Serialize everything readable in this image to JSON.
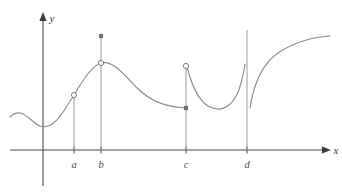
{
  "figure": {
    "background_color": "#ffffff",
    "curve_color": "#8c8c94",
    "axis_color": "#4a4a4a",
    "marker_color": "#7a7a82",
    "dropline_color": "#9a9aa2",
    "axes": {
      "x_label": "x",
      "y_label": "y"
    },
    "tick_labels": [
      "a",
      "b",
      "c",
      "d"
    ]
  },
  "chart_data": {
    "type": "line",
    "title": "",
    "xlabel": "x",
    "ylabel": "y",
    "grid": false,
    "legend": null,
    "xlim": [
      0,
      342
    ],
    "ylim": [
      0,
      196
    ],
    "axis_origin_px": {
      "x": 35,
      "y": 150
    },
    "tick_positions_px": [
      74,
      101,
      186,
      247
    ],
    "tick_labels": [
      "a",
      "b",
      "c",
      "d"
    ],
    "segments": [
      {
        "name": "left-branch",
        "from_label": "start",
        "to_label": "b-peak",
        "path": "M 10,117 C 22,105 30,122 40,126 C 52,130 60,118 74,95 C 84,78 92,66 101,63",
        "note": "Enters from upper left, dips to a local minimum near x just right of the y-axis, then rises steeply through a to a local maximum at b."
      },
      {
        "name": "b-to-c-branch",
        "from_label": "b-peak",
        "to_label": "c-left",
        "path": "M 101,63 C 112,60 122,72 136,87 C 152,103 168,107 186,108",
        "note": "Descends from the peak at b and flattens out approaching c from the left."
      },
      {
        "name": "c-to-d-branch",
        "from_label": "c-right",
        "to_label": "d-left",
        "path": "M 187,67 C 192,86 198,100 208,106 C 220,113 232,108 239,90 C 242,80 244,72 245,64",
        "note": "Starts high just right of c, falls to a local minimum, then rises steeply toward the vertical asymptote at d."
      },
      {
        "name": "after-d-branch",
        "from_label": "d-right",
        "to_label": "end",
        "path": "M 250,108 C 254,82 262,64 278,53 C 296,41 314,37 330,36",
        "note": "Emerges just right of d, rises steeply and then levels off toward the right edge."
      }
    ],
    "markers": [
      {
        "label": "a",
        "type": "open-circle",
        "x_px": 74,
        "y_px": 95,
        "meaning": "removable discontinuity (hole) at x = a"
      },
      {
        "label": "b",
        "type": "open-circle",
        "x_px": 101,
        "y_px": 63,
        "meaning": "hole on the curve at x = b"
      },
      {
        "label": "b",
        "type": "filled-dot",
        "x_px": 101,
        "y_px": 36,
        "meaning": "defined function value at x = b, above the curve"
      },
      {
        "label": "c",
        "type": "filled-dot",
        "x_px": 186,
        "y_px": 108,
        "meaning": "left-hand value included at x = c"
      },
      {
        "label": "c",
        "type": "open-circle",
        "x_px": 186,
        "y_px": 66,
        "meaning": "right-hand limit not attained at x = c"
      }
    ],
    "droplines": [
      {
        "label": "a",
        "x_px": 74,
        "y_top_px": 95,
        "y_bottom_px": 150
      },
      {
        "label": "b",
        "x_px": 101,
        "y_top_px": 36,
        "y_bottom_px": 150
      },
      {
        "label": "c",
        "x_px": 186,
        "y_top_px": 66,
        "y_bottom_px": 150
      },
      {
        "label": "d",
        "x_px": 247,
        "y_top_px": 30,
        "y_bottom_px": 150
      }
    ]
  }
}
